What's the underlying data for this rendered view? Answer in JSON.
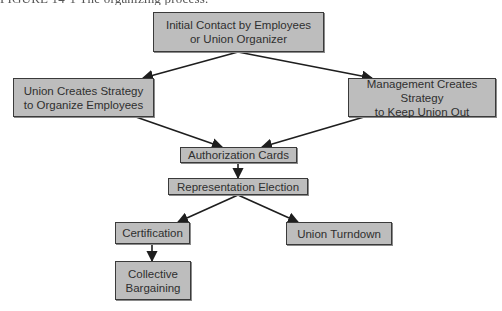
{
  "diagram": {
    "caption_visible_fragment": "FIGURE 14-1 The organizing process.",
    "colors": {
      "box_fill": "#bdbdbd",
      "box_border": "#3a3a3a",
      "text": "#2f2f2f",
      "arrow": "#1e1e1e"
    },
    "nodes": [
      {
        "id": "initial_contact",
        "label": "Initial Contact by Employees\nor Union Organizer",
        "x": 153,
        "y": 12,
        "w": 171,
        "h": 40
      },
      {
        "id": "union_strategy",
        "label": "Union Creates Strategy\nto Organize Employees",
        "x": 13,
        "y": 78,
        "w": 141,
        "h": 39
      },
      {
        "id": "management_strategy",
        "label": "Management Creates Strategy\nto Keep Union Out",
        "x": 348,
        "y": 78,
        "w": 148,
        "h": 39
      },
      {
        "id": "authorization_cards",
        "label": "Authorization Cards",
        "x": 180,
        "y": 147,
        "w": 117,
        "h": 16
      },
      {
        "id": "representation_election",
        "label": "Representation Election",
        "x": 168,
        "y": 178,
        "w": 140,
        "h": 17
      },
      {
        "id": "certification",
        "label": "Certification",
        "x": 115,
        "y": 222,
        "w": 75,
        "h": 22
      },
      {
        "id": "union_turndown",
        "label": "Union Turndown",
        "x": 286,
        "y": 222,
        "w": 106,
        "h": 23
      },
      {
        "id": "collective_bargaining",
        "label": "Collective\nBargaining",
        "x": 115,
        "y": 261,
        "w": 76,
        "h": 39
      }
    ],
    "edges": [
      {
        "from": "initial_contact",
        "to": "union_strategy"
      },
      {
        "from": "initial_contact",
        "to": "management_strategy"
      },
      {
        "from": "union_strategy",
        "to": "authorization_cards"
      },
      {
        "from": "management_strategy",
        "to": "authorization_cards"
      },
      {
        "from": "authorization_cards",
        "to": "representation_election"
      },
      {
        "from": "representation_election",
        "to": "certification"
      },
      {
        "from": "representation_election",
        "to": "union_turndown"
      },
      {
        "from": "certification",
        "to": "collective_bargaining"
      }
    ]
  }
}
